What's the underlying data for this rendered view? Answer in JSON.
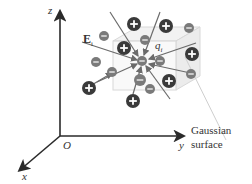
{
  "diagram": {
    "axes": {
      "z_label": "z",
      "y_label": "y",
      "x_label": "x",
      "origin_label": "O"
    },
    "field_label": "E",
    "field_subscript": "i",
    "charge_label": "q",
    "charge_subscript": "i",
    "surface_label_line1": "Gaussian",
    "surface_label_line2": "surface",
    "colors": {
      "axis": "#2a2a2a",
      "field_line": "#6b6b6b",
      "positive_charge": "#3a3a3a",
      "negative_charge": "#7a7a7a",
      "surface": "#d8d8d8",
      "text": "#333333"
    },
    "charges": [
      {
        "type": "positive",
        "x": 134,
        "y": 24,
        "r": 7
      },
      {
        "type": "positive",
        "x": 166,
        "y": 26,
        "r": 7
      },
      {
        "type": "negative",
        "x": 189,
        "y": 28,
        "r": 5
      },
      {
        "type": "negative",
        "x": 104,
        "y": 36,
        "r": 5
      },
      {
        "type": "positive",
        "x": 124,
        "y": 48,
        "r": 7
      },
      {
        "type": "negative",
        "x": 145,
        "y": 40,
        "r": 5
      },
      {
        "type": "positive",
        "x": 192,
        "y": 54,
        "r": 7
      },
      {
        "type": "negative",
        "x": 96,
        "y": 62,
        "r": 5
      },
      {
        "type": "negative",
        "x": 142,
        "y": 61,
        "r": 5,
        "label": "q_i"
      },
      {
        "type": "negative",
        "x": 160,
        "y": 61,
        "r": 5
      },
      {
        "type": "negative",
        "x": 112,
        "y": 72,
        "r": 5
      },
      {
        "type": "positive",
        "x": 89,
        "y": 88,
        "r": 7
      },
      {
        "type": "negative",
        "x": 140,
        "y": 80,
        "r": 6
      },
      {
        "type": "negative",
        "x": 191,
        "y": 74,
        "r": 5
      },
      {
        "type": "positive",
        "x": 169,
        "y": 81,
        "r": 7
      },
      {
        "type": "negative",
        "x": 150,
        "y": 89,
        "r": 5
      },
      {
        "type": "positive",
        "x": 133,
        "y": 101,
        "r": 7
      }
    ],
    "field_lines": [
      {
        "x1": 82,
        "y1": 42,
        "x2": 137,
        "y2": 60
      },
      {
        "x1": 110,
        "y1": 12,
        "x2": 138,
        "y2": 56
      },
      {
        "x1": 160,
        "y1": 12,
        "x2": 144,
        "y2": 55
      },
      {
        "x1": 196,
        "y1": 43,
        "x2": 149,
        "y2": 59
      },
      {
        "x1": 195,
        "y1": 74,
        "x2": 149,
        "y2": 64
      },
      {
        "x1": 170,
        "y1": 99,
        "x2": 146,
        "y2": 66
      },
      {
        "x1": 133,
        "y1": 94,
        "x2": 141,
        "y2": 67
      },
      {
        "x1": 97,
        "y1": 82,
        "x2": 137,
        "y2": 64
      },
      {
        "x1": 90,
        "y1": 86,
        "x2": 112,
        "y2": 73
      }
    ]
  }
}
